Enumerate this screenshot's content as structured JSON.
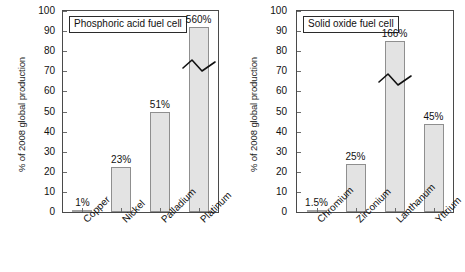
{
  "figure": {
    "background": "#ffffff",
    "bar_fill": "#e3e3e3",
    "bar_stroke": "#8f8f8f",
    "axis_color": "#4a4a4a"
  },
  "axis": {
    "ylabel": "% of 2008 global production",
    "yticks": [
      "0",
      "10",
      "20",
      "30",
      "40",
      "50",
      "60",
      "70",
      "80",
      "90",
      "100"
    ]
  },
  "chart_data": [
    {
      "type": "bar",
      "title": "Phosphoric acid fuel cell",
      "xlabel": "",
      "ylabel": "% of 2008 global production",
      "ylim": [
        0,
        100
      ],
      "grid": false,
      "legend": "none",
      "categories": [
        "Copper",
        "Nickel",
        "Palladium",
        "Platinum"
      ],
      "values": [
        1,
        23,
        51,
        560
      ],
      "data_labels": [
        "1%",
        "23%",
        "51%",
        "560%"
      ],
      "drawn_heights": [
        1,
        22.5,
        50,
        92
      ],
      "truncated": [
        false,
        false,
        false,
        true
      ],
      "annotations": [
        "axis-break zigzag drawn across Platinum bar"
      ]
    },
    {
      "type": "bar",
      "title": "Solid oxide fuel cell",
      "xlabel": "",
      "ylabel": "% of 2008 global production",
      "ylim": [
        0,
        100
      ],
      "grid": false,
      "legend": "none",
      "categories": [
        "Chromium",
        "Zirconium",
        "Lanthanum",
        "Yttrium"
      ],
      "values": [
        1.5,
        25,
        166,
        45
      ],
      "data_labels": [
        "1.5%",
        "25%",
        "166%",
        "45%"
      ],
      "drawn_heights": [
        1.2,
        24,
        85,
        44
      ],
      "truncated": [
        false,
        false,
        true,
        false
      ],
      "annotations": [
        "axis-break zigzag drawn across Lanthanum bar"
      ]
    }
  ]
}
